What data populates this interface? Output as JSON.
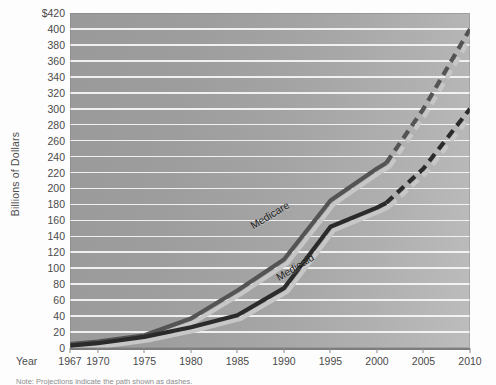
{
  "chart_data": {
    "type": "line",
    "title": "",
    "xlabel": "Year",
    "ylabel": "Billions of Dollars",
    "ylim": [
      0,
      420
    ],
    "ytick_step": 20,
    "ytick_labels": [
      "$420",
      "400",
      "380",
      "360",
      "340",
      "320",
      "300",
      "280",
      "260",
      "240",
      "220",
      "200",
      "180",
      "160",
      "140",
      "120",
      "100",
      "80",
      "60",
      "40",
      "20",
      "0"
    ],
    "xlim": [
      1967,
      2010
    ],
    "xtick_labels": [
      "1967",
      "1970",
      "1975",
      "1980",
      "1985",
      "1990",
      "1995",
      "2000",
      "2005",
      "2010"
    ],
    "grid": "horizontal",
    "legend": "inline-labels",
    "background_color": "#9a9a9a",
    "gridline_color": "#f4f4f4",
    "series": [
      {
        "name": "Medicare",
        "color": "#545454",
        "shadow_color": "#c7c7c7",
        "actual": {
          "x": [
            1967,
            1970,
            1975,
            1980,
            1985,
            1990,
            1995,
            2000,
            2001
          ],
          "y": [
            5,
            8,
            16,
            37,
            72,
            111,
            185,
            225,
            232
          ]
        },
        "projected": {
          "x": [
            2001,
            2005,
            2010
          ],
          "y": [
            232,
            300,
            400
          ]
        }
      },
      {
        "name": "Medicaid",
        "color": "#2b2b2b",
        "shadow_color": "#c7c7c7",
        "actual": {
          "x": [
            1967,
            1970,
            1975,
            1980,
            1985,
            1990,
            1995,
            2000,
            2001
          ],
          "y": [
            3,
            6,
            14,
            26,
            41,
            75,
            152,
            176,
            182
          ]
        },
        "projected": {
          "x": [
            2001,
            2005,
            2010
          ],
          "y": [
            182,
            225,
            300
          ]
        }
      }
    ]
  },
  "axes": {
    "y_title": "Billions of Dollars",
    "x_title": "Year"
  },
  "note": {
    "text": "Note: Projections indicate the path shown as dashes."
  }
}
